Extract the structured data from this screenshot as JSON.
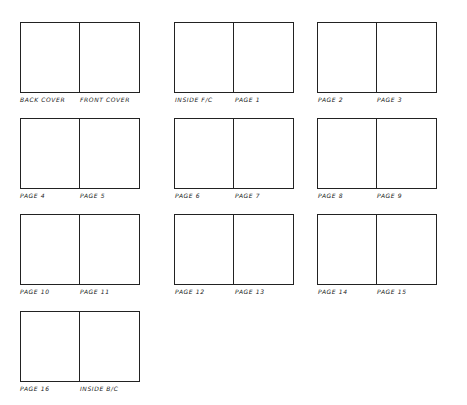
{
  "spreads": [
    {
      "left": "BACK COVER",
      "right": "FRONT COVER"
    },
    {
      "left": "INSIDE F/C",
      "right": "PAGE 1"
    },
    {
      "left": "PAGE 2",
      "right": "PAGE 3"
    },
    {
      "left": "PAGE 4",
      "right": "PAGE 5"
    },
    {
      "left": "PAGE 6",
      "right": "PAGE 7"
    },
    {
      "left": "PAGE 8",
      "right": "PAGE 9"
    },
    {
      "left": "PAGE 10",
      "right": "PAGE 11"
    },
    {
      "left": "PAGE 12",
      "right": "PAGE 13"
    },
    {
      "left": "PAGE 14",
      "right": "PAGE 15"
    },
    {
      "left": "PAGE 16",
      "right": "INSIDE B/C"
    }
  ],
  "line_color": "#222222"
}
